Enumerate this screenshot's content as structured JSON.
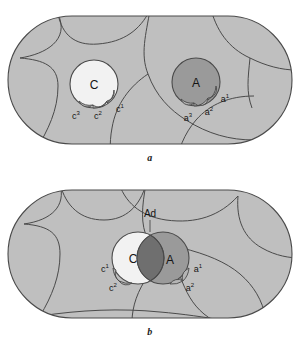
{
  "figure": {
    "title": "",
    "panels": [
      {
        "id": "a",
        "caption": "a",
        "regions_label": "cell-outline-stadium",
        "circles": [
          {
            "name": "C",
            "label": "C",
            "fill": "#f2f2f2"
          },
          {
            "name": "A",
            "label": "A",
            "fill": "#9a9a9a"
          }
        ],
        "lobe_labels": {
          "c3": "c",
          "c3_sup": "3",
          "c2": "c",
          "c2_sup": "2",
          "c1": "c",
          "c1_sup": "1",
          "a3": "a",
          "a3_sup": "3",
          "a2": "a",
          "a2_sup": "2",
          "a1": "a",
          "a1_sup": "1"
        }
      },
      {
        "id": "b",
        "caption": "b",
        "regions_label": "cell-outline-stadium",
        "circles": [
          {
            "name": "C",
            "label": "C",
            "fill": "#f2f2f2"
          },
          {
            "name": "A",
            "label": "A",
            "fill": "#9a9a9a"
          },
          {
            "name": "Ad",
            "label": "Ad",
            "fill": "#6f6f6f"
          }
        ],
        "lobe_labels": {
          "c1": "c",
          "c1_sup": "1",
          "c2": "c",
          "c2_sup": "2",
          "a1": "a",
          "a1_sup": "1",
          "a2": "a",
          "a2_sup": "2"
        }
      }
    ],
    "colors": {
      "background": "#ffffff",
      "tissue_fill": "#bfbfbf",
      "outline_stroke": "#4a4a4a",
      "circle_light": "#f2f2f2",
      "circle_mid": "#9a9a9a",
      "circle_dark": "#6f6f6f",
      "lobe_fill": "#b5b5b5",
      "text": "#141414"
    }
  }
}
